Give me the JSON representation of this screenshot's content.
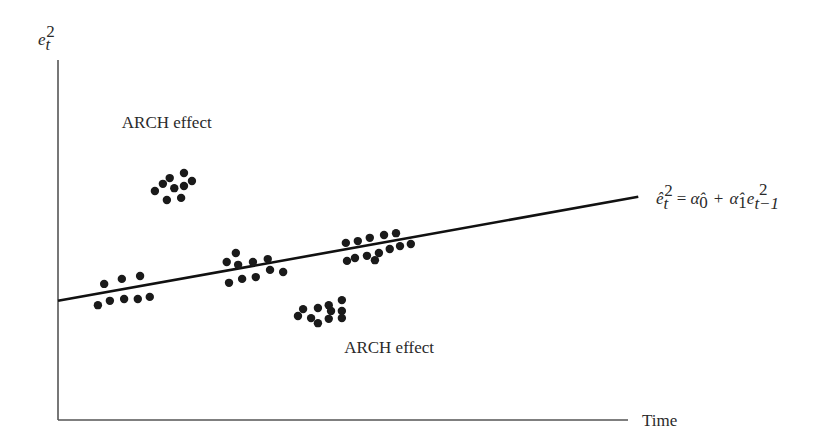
{
  "chart_data": {
    "type": "scatter",
    "title": "",
    "xlabel": "Time",
    "ylabel_base": "e",
    "ylabel_sub": "t",
    "ylabel_sup": "2",
    "xlim": [
      0,
      100
    ],
    "ylim": [
      0,
      100
    ],
    "grid": false,
    "ticks": "none",
    "regression_line": {
      "label": "ê²ₜ = α̂₀ + α̂₁e²ₜ₋₁",
      "start": [
        0,
        33.1
      ],
      "end": [
        101.8,
        62.0
      ]
    },
    "equation": {
      "lhs_base": "ê",
      "lhs_sub": "t",
      "lhs_sup": "2",
      "eq": "=",
      "a0_base": "α̂",
      "a0_sub": "0",
      "plus": "+",
      "a1_base": "α̂",
      "a1_sub": "1",
      "e_base": "e",
      "e_sub": "t−1",
      "e_sup": "2"
    },
    "annotations": [
      {
        "text": "ARCH effect",
        "at": [
          11.2,
          81.0
        ]
      },
      {
        "text": "ARCH effect",
        "at": [
          50.2,
          18.6
        ]
      }
    ],
    "series": [
      {
        "name": "cluster-arch-high",
        "points": [
          [
            17.0,
            63.6
          ],
          [
            18.4,
            65.6
          ],
          [
            19.6,
            67.2
          ],
          [
            22.1,
            68.6
          ],
          [
            20.4,
            64.4
          ],
          [
            22.1,
            65.0
          ],
          [
            23.5,
            66.4
          ],
          [
            19.1,
            61.1
          ],
          [
            21.6,
            61.7
          ]
        ]
      },
      {
        "name": "cluster-1",
        "points": [
          [
            8.1,
            37.8
          ],
          [
            11.2,
            39.2
          ],
          [
            14.4,
            40.0
          ],
          [
            7.0,
            31.9
          ],
          [
            9.1,
            33.1
          ],
          [
            11.6,
            33.6
          ],
          [
            14.0,
            33.6
          ],
          [
            16.1,
            34.2
          ]
        ]
      },
      {
        "name": "cluster-2",
        "points": [
          [
            31.2,
            46.4
          ],
          [
            29.6,
            43.9
          ],
          [
            31.6,
            43.1
          ],
          [
            34.2,
            43.9
          ],
          [
            36.8,
            44.7
          ],
          [
            30.0,
            38.1
          ],
          [
            32.3,
            39.2
          ],
          [
            34.7,
            39.7
          ],
          [
            37.2,
            41.7
          ],
          [
            39.5,
            41.1
          ]
        ]
      },
      {
        "name": "cluster-3",
        "points": [
          [
            50.5,
            49.2
          ],
          [
            52.6,
            49.7
          ],
          [
            54.7,
            50.6
          ],
          [
            57.2,
            51.4
          ],
          [
            59.3,
            51.9
          ],
          [
            50.7,
            44.2
          ],
          [
            52.1,
            45.0
          ],
          [
            54.2,
            45.6
          ],
          [
            56.3,
            46.4
          ],
          [
            58.2,
            47.5
          ],
          [
            60.0,
            48.3
          ],
          [
            61.9,
            48.9
          ],
          [
            55.6,
            44.4
          ]
        ]
      },
      {
        "name": "cluster-arch-low",
        "points": [
          [
            43.0,
            30.8
          ],
          [
            45.6,
            31.1
          ],
          [
            47.5,
            31.9
          ],
          [
            49.8,
            33.3
          ],
          [
            42.1,
            28.9
          ],
          [
            44.4,
            28.3
          ],
          [
            45.6,
            26.9
          ],
          [
            47.5,
            28.1
          ],
          [
            49.8,
            28.3
          ],
          [
            47.9,
            30.3
          ],
          [
            49.8,
            30.3
          ]
        ]
      }
    ]
  }
}
